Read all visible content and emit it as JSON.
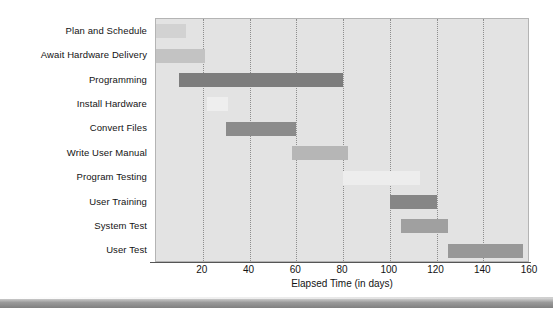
{
  "chart_data": {
    "type": "bar",
    "subtype": "gantt",
    "title": "",
    "xlabel": "Elapsed Time (in days)",
    "ylabel": "",
    "xlim": [
      0,
      160
    ],
    "xticks": [
      20,
      40,
      60,
      80,
      100,
      120,
      140,
      160
    ],
    "grid": "vertical-dotted",
    "legend": "none",
    "categories": [
      "Plan and Schedule",
      "Await Hardware Delivery",
      "Programming",
      "Install Hardware",
      "Convert Files",
      "Write User Manual",
      "Program Testing",
      "User Training",
      "System Test",
      "User Test"
    ],
    "tasks": [
      {
        "name": "Plan and Schedule",
        "start": 0,
        "end": 13,
        "duration": 13,
        "color": "#d2d2d2"
      },
      {
        "name": "Await Hardware Delivery",
        "start": 0,
        "end": 21,
        "duration": 21,
        "color": "#c3c3c3"
      },
      {
        "name": "Programming",
        "start": 10,
        "end": 80,
        "duration": 70,
        "color": "#7d7d7d"
      },
      {
        "name": "Install Hardware",
        "start": 22,
        "end": 31,
        "duration": 9,
        "color": "#eeeeee"
      },
      {
        "name": "Convert Files",
        "start": 30,
        "end": 60,
        "duration": 30,
        "color": "#8b8b8b"
      },
      {
        "name": "Write User Manual",
        "start": 58,
        "end": 82,
        "duration": 24,
        "color": "#b6b6b6"
      },
      {
        "name": "Program Testing",
        "start": 80,
        "end": 113,
        "duration": 33,
        "color": "#ededed"
      },
      {
        "name": "User Training",
        "start": 100,
        "end": 120,
        "duration": 20,
        "color": "#868686"
      },
      {
        "name": "System Test",
        "start": 105,
        "end": 125,
        "duration": 20,
        "color": "#a0a0a0"
      },
      {
        "name": "User Test",
        "start": 125,
        "end": 157,
        "duration": 32,
        "color": "#989898"
      }
    ],
    "colors": {
      "plot_background": "#e3e3e3",
      "plot_border": "#b4b4b4",
      "gridline": "#8d8d8d",
      "axis": "#555555",
      "text": "#131313"
    }
  }
}
